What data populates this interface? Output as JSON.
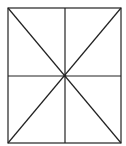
{
  "diagram": {
    "width": 126,
    "height": 146,
    "stroke_color": "#222222",
    "background": "#ffffff",
    "rectangle": {
      "x1": 8,
      "y1": 8,
      "x2": 121,
      "y2": 143
    },
    "center": {
      "x": 65,
      "y": 76
    },
    "lines": [
      {
        "name": "vertical-midline",
        "x1": 65,
        "y1": 8,
        "x2": 65,
        "y2": 143
      },
      {
        "name": "horizontal-midline",
        "x1": 8,
        "y1": 76,
        "x2": 121,
        "y2": 76
      },
      {
        "name": "diagonal-tl-br",
        "x1": 8,
        "y1": 8,
        "x2": 121,
        "y2": 143
      },
      {
        "name": "diagonal-tr-bl",
        "x1": 121,
        "y1": 8,
        "x2": 8,
        "y2": 143
      }
    ]
  }
}
